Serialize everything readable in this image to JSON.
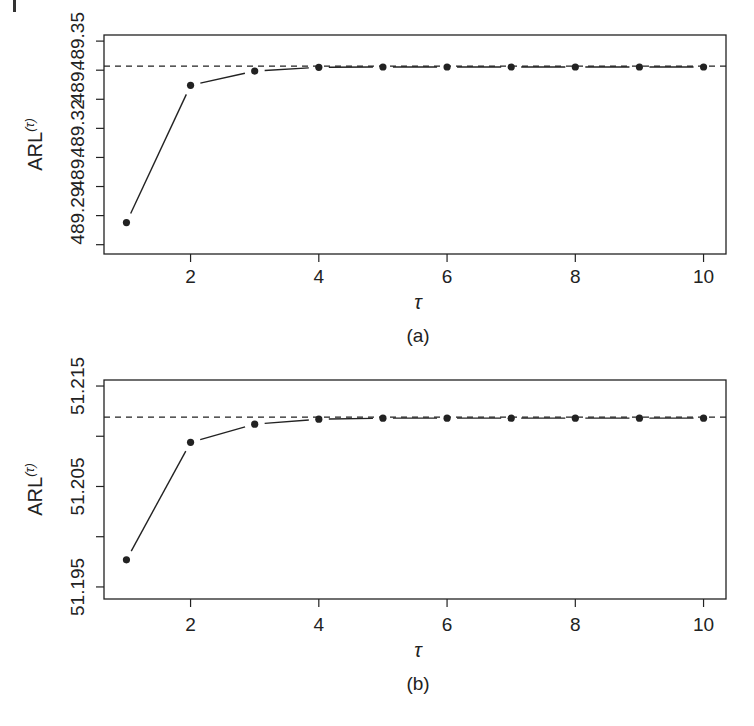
{
  "chart_data": [
    {
      "type": "line",
      "panel": "(a)",
      "title": "",
      "xlabel": "τ",
      "ylabel": "ARL(τ)",
      "x": [
        1,
        2,
        3,
        4,
        5,
        6,
        7,
        8,
        9,
        10
      ],
      "series": [
        {
          "name": "ARL(τ)",
          "style": "points joined by solid line",
          "values": [
            489.2876,
            489.3348,
            489.3397,
            489.341,
            489.3411,
            489.3411,
            489.3411,
            489.3411,
            489.3411,
            489.3411
          ]
        }
      ],
      "reference_line": {
        "style": "dashed",
        "y": 489.3414
      },
      "xticks": [
        2,
        4,
        6,
        8,
        10
      ],
      "yticks": [
        489.28,
        489.29,
        489.3,
        489.31,
        489.32,
        489.33,
        489.34,
        489.35
      ],
      "ytick_labels_visible": [
        "489.35",
        "489.32",
        "489.29"
      ],
      "xlim": [
        0.65,
        10.35
      ],
      "ylim": [
        489.2768,
        489.3521
      ],
      "grid": false,
      "legend": null
    },
    {
      "type": "line",
      "panel": "(b)",
      "title": "",
      "xlabel": "τ",
      "ylabel": "ARL(τ)",
      "x": [
        1,
        2,
        3,
        4,
        5,
        6,
        7,
        8,
        9,
        10
      ],
      "series": [
        {
          "name": "ARL(τ)",
          "style": "points joined by solid line",
          "values": [
            51.1977,
            51.2094,
            51.2112,
            51.2117,
            51.2118,
            51.2118,
            51.2118,
            51.2118,
            51.2118,
            51.2118
          ]
        }
      ],
      "reference_line": {
        "style": "dashed",
        "y": 51.2119
      },
      "xticks": [
        2,
        4,
        6,
        8,
        10
      ],
      "yticks": [
        51.195,
        51.2,
        51.205,
        51.21,
        51.215
      ],
      "ytick_labels_visible": [
        "51.215",
        "51.205",
        "51.195"
      ],
      "xlim": [
        0.65,
        10.35
      ],
      "ylim": [
        51.1938,
        51.2156
      ],
      "grid": false,
      "legend": null
    }
  ],
  "panels": [
    {
      "caption": "(a)",
      "xlabel": "τ",
      "ylabel_main": "ARL",
      "ylabel_sup": "(τ)",
      "xtick_labels": [
        "2",
        "4",
        "6",
        "8",
        "10"
      ],
      "ytick_labels": [
        {
          "text": "489.35",
          "y": 489.35
        },
        {
          "text": "489.",
          "y": 489.335
        },
        {
          "text": "489.32",
          "y": 489.32
        },
        {
          "text": "489.",
          "y": 489.305
        },
        {
          "text": "489.29",
          "y": 489.29
        }
      ]
    },
    {
      "caption": "(b)",
      "xlabel": "τ",
      "ylabel_main": "ARL",
      "ylabel_sup": "(τ)",
      "xtick_labels": [
        "2",
        "4",
        "6",
        "8",
        "10"
      ],
      "ytick_labels": [
        {
          "text": "51.215",
          "y": 51.215
        },
        {
          "text": "51.205",
          "y": 51.205
        },
        {
          "text": "51.195",
          "y": 51.195
        }
      ]
    }
  ],
  "colors": {
    "ink": "#222222",
    "background": "#ffffff"
  }
}
